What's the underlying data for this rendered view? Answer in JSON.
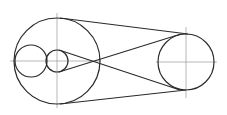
{
  "diagram": {
    "type": "belt-drive-construction",
    "colors": {
      "outline": "#2a2a2a",
      "centerline": "#9a9a9a",
      "background": "#ffffff"
    },
    "circles": [
      {
        "id": "large-left",
        "cx": 57,
        "cy": 61,
        "r": 43
      },
      {
        "id": "small-left",
        "cx": 31,
        "cy": 61,
        "r": 16
      },
      {
        "id": "small-middle",
        "cx": 57,
        "cy": 61,
        "r": 11
      },
      {
        "id": "right",
        "cx": 186,
        "cy": 62,
        "r": 28
      }
    ],
    "belt_lines": [
      {
        "id": "outer-top",
        "x1": 60,
        "y1": 18,
        "x2": 188,
        "y2": 34
      },
      {
        "id": "outer-bottom",
        "x1": 60,
        "y1": 104,
        "x2": 186,
        "y2": 90
      },
      {
        "id": "cross-a",
        "x1": 59,
        "y1": 50,
        "x2": 180,
        "y2": 90
      },
      {
        "id": "cross-b",
        "x1": 59,
        "y1": 72,
        "x2": 181,
        "y2": 34
      }
    ],
    "centerlines": [
      {
        "id": "left-horizontal",
        "x1": 10,
        "y1": 61,
        "x2": 101,
        "y2": 61
      },
      {
        "id": "left-vertical",
        "x1": 57,
        "y1": 13,
        "x2": 57,
        "y2": 108
      },
      {
        "id": "right-horizontal",
        "x1": 156,
        "y1": 62,
        "x2": 217,
        "y2": 62
      },
      {
        "id": "right-vertical",
        "x1": 186,
        "y1": 27,
        "x2": 186,
        "y2": 98
      }
    ]
  }
}
